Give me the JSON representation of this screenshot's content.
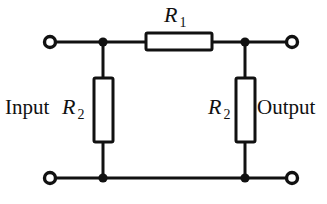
{
  "figure": {
    "name": "resistive-attenuator-circuit",
    "type": "schematic-diagram",
    "width": 327,
    "height": 204,
    "background_color": "#ffffff",
    "line_color": "#111111"
  },
  "labels": {
    "input": "Input",
    "output": "Output",
    "r1_symbol": "R",
    "r1_subscript": "1",
    "r2_symbol": "R",
    "r2_subscript": "2"
  },
  "components": {
    "series_resistor": {
      "label_symbol": "R",
      "label_subscript": "1",
      "orientation": "horizontal",
      "box": {
        "x": 146,
        "y": 33,
        "width": 66,
        "height": 17
      }
    },
    "shunt_resistor_left": {
      "label_symbol": "R",
      "label_subscript": "2",
      "orientation": "vertical",
      "box": {
        "x": 94,
        "y": 78,
        "width": 19,
        "height": 64
      }
    },
    "shunt_resistor_right": {
      "label_symbol": "R",
      "label_subscript": "2",
      "orientation": "vertical",
      "box": {
        "x": 236,
        "y": 78,
        "width": 19,
        "height": 64
      }
    }
  },
  "nodes": {
    "terminals": [
      {
        "name": "input-top-terminal",
        "cx": 50,
        "cy": 42,
        "r": 5.5
      },
      {
        "name": "input-bottom-terminal",
        "cx": 50,
        "cy": 178,
        "r": 5.5
      },
      {
        "name": "output-top-terminal",
        "cx": 292,
        "cy": 42,
        "r": 5.5
      },
      {
        "name": "output-bottom-terminal",
        "cx": 292,
        "cy": 178,
        "r": 5.5
      }
    ],
    "junctions": [
      {
        "name": "junction-top-left",
        "cx": 103,
        "cy": 42,
        "r": 4.6
      },
      {
        "name": "junction-top-right",
        "cx": 245,
        "cy": 42,
        "r": 4.6
      },
      {
        "name": "junction-bottom-left",
        "cx": 103,
        "cy": 178,
        "r": 4.6
      },
      {
        "name": "junction-bottom-right",
        "cx": 245,
        "cy": 178,
        "r": 4.6
      }
    ]
  },
  "wires": {
    "top_rail_y": 42,
    "bottom_rail_y": 178,
    "stroke_width": 3
  }
}
